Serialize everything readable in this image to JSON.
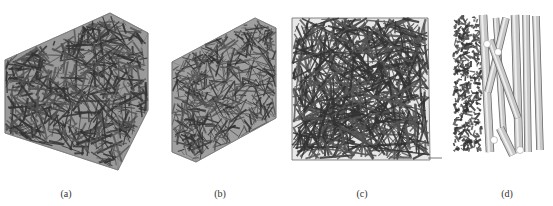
{
  "figure": {
    "panels": [
      {
        "id": "a",
        "label": "(a)",
        "description": "3D random fiber network in box (isometric)",
        "label_x": 66
      },
      {
        "id": "b",
        "label": "(b)",
        "description": "3D fiber network in box, thinner slab",
        "label_x": 220
      },
      {
        "id": "c",
        "label": "(c)",
        "description": "Top view of fiber network",
        "label_x": 362
      },
      {
        "id": "d",
        "label": "(d)",
        "description": "Side view with cylindrical fibers",
        "label_x": 507
      }
    ],
    "colors": {
      "fiber": "#555555",
      "fiber_dark": "#333333",
      "box": "#777777",
      "cylinder_light": "#c8c8c8"
    }
  }
}
